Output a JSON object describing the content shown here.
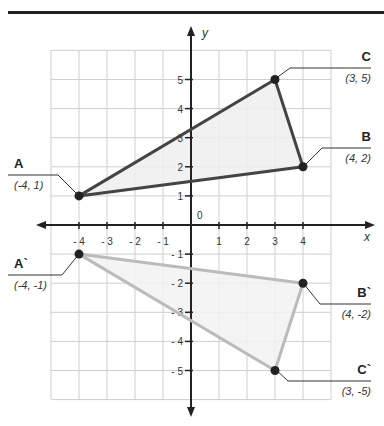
{
  "chart_data": {
    "type": "scatter",
    "title": "",
    "xlabel": "x",
    "ylabel": "y",
    "xlim": [
      -5,
      5
    ],
    "ylim": [
      -6,
      6
    ],
    "grid": true,
    "x_ticks": [
      -4,
      -3,
      -2,
      -1,
      1,
      2,
      3,
      4
    ],
    "x_tick_labels": [
      "- 4",
      "- 3",
      "- 2",
      "- 1",
      "1",
      "2",
      "3",
      "4"
    ],
    "y_ticks": [
      5,
      4,
      3,
      2,
      1,
      -1,
      -2,
      -3,
      -4,
      -5
    ],
    "y_tick_labels": [
      "5",
      "4",
      "3",
      "2",
      "1",
      "- 1",
      "- 2",
      "- 3",
      "- 4",
      "- 5"
    ],
    "origin_label": "0",
    "series": [
      {
        "name": "Triangle ABC",
        "color": "#444444",
        "points": [
          {
            "label": "A",
            "x": -4,
            "y": 1,
            "coord": "(-4, 1)"
          },
          {
            "label": "B",
            "x": 4,
            "y": 2,
            "coord": "(4, 2)"
          },
          {
            "label": "C",
            "x": 3,
            "y": 5,
            "coord": "(3, 5)"
          }
        ]
      },
      {
        "name": "Triangle A`B`C` (reflection across x-axis)",
        "color": "#bbbbbb",
        "points": [
          {
            "label": "A`",
            "x": -4,
            "y": -1,
            "coord": "(-4, -1)"
          },
          {
            "label": "B`",
            "x": 4,
            "y": -2,
            "coord": "(4, -2)"
          },
          {
            "label": "C`",
            "x": 3,
            "y": -5,
            "coord": "(3, -5)"
          }
        ]
      }
    ]
  },
  "labels": {
    "x_axis": "x",
    "y_axis": "y",
    "origin": "0",
    "A": {
      "name": "A",
      "coord": "(-4, 1)"
    },
    "B": {
      "name": "B",
      "coord": "(4, 2)"
    },
    "C": {
      "name": "C",
      "coord": "(3, 5)"
    },
    "A2": {
      "name": "A`",
      "coord": "(-4, -1)"
    },
    "B2": {
      "name": "B`",
      "coord": "(4, -2)"
    },
    "C2": {
      "name": "C`",
      "coord": "(3, -5)"
    }
  },
  "colors": {
    "original": "#444444",
    "reflected": "#bbbbbb",
    "fill": "#efefef",
    "grid": "#cfcfcf"
  }
}
